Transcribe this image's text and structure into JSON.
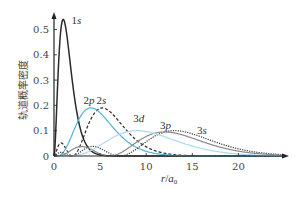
{
  "chart_data": {
    "type": "line",
    "title": "",
    "xlabel": "r/a₀",
    "ylabel": "轨道概率密度",
    "xlim": [
      0,
      25
    ],
    "ylim": [
      0,
      0.55
    ],
    "x_ticks": [
      0,
      5,
      10,
      15,
      20
    ],
    "y_ticks": [
      0,
      0.1,
      0.2,
      0.3,
      0.4,
      0.5
    ],
    "x_tick_labels": [
      "0",
      "5",
      "10",
      "15",
      "20"
    ],
    "y_tick_labels": [
      "0",
      "0.1",
      "0.2",
      "0.3",
      "0.4",
      "0.5"
    ],
    "grid": false,
    "legend": "inline labels",
    "series": [
      {
        "name": "1s",
        "orbital": "1s",
        "style": "solid",
        "color": "#2b2b2b",
        "peak_x": 1.0,
        "peak_y": 0.54
      },
      {
        "name": "2s",
        "orbital": "2s",
        "style": "dashed",
        "color": "#2b2b2b",
        "peak_x": 5.2,
        "peak_y": 0.19
      },
      {
        "name": "2p",
        "orbital": "2p",
        "style": "solid",
        "color": "#4fb3d9",
        "peak_x": 4.0,
        "peak_y": 0.19
      },
      {
        "name": "3s",
        "orbital": "3s",
        "style": "dotted",
        "color": "#3a3a3a",
        "peak_x": 13.1,
        "peak_y": 0.1
      },
      {
        "name": "3p",
        "orbital": "3p",
        "style": "solid",
        "color": "#8a8a8a",
        "peak_x": 12.0,
        "peak_y": 0.095
      },
      {
        "name": "3d",
        "orbital": "3d",
        "style": "solid",
        "color": "#a9dcef",
        "peak_x": 9.0,
        "peak_y": 0.1
      }
    ],
    "labels": [
      {
        "text_n": "1",
        "text_l": "s",
        "x": 1.9,
        "y": 0.52
      },
      {
        "text_n": "2",
        "text_l": "p",
        "x": 3.2,
        "y": 0.205
      },
      {
        "text_n": "2",
        "text_l": "s",
        "x": 4.6,
        "y": 0.205
      },
      {
        "text_n": "3",
        "text_l": "d",
        "x": 8.6,
        "y": 0.135
      },
      {
        "text_n": "3",
        "text_l": "p",
        "x": 11.5,
        "y": 0.105
      },
      {
        "text_n": "3",
        "text_l": "s",
        "x": 15.5,
        "y": 0.085
      }
    ]
  }
}
